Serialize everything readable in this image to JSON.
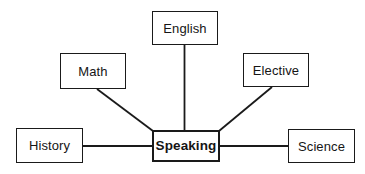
{
  "diagram": {
    "type": "mind-map",
    "background_color": "#ffffff",
    "line_color": "#1a1a1a",
    "text_color": "#151515",
    "central_node": {
      "id": "speaking",
      "label": "Speaking",
      "bold": true
    },
    "nodes": [
      {
        "id": "english",
        "label": "English"
      },
      {
        "id": "math",
        "label": "Math"
      },
      {
        "id": "elective",
        "label": "Elective"
      },
      {
        "id": "history",
        "label": "History"
      },
      {
        "id": "science",
        "label": "Science"
      }
    ],
    "connections": [
      {
        "from": "english",
        "to": "speaking",
        "style": "vertical"
      },
      {
        "from": "math",
        "to": "speaking",
        "style": "diagonal"
      },
      {
        "from": "elective",
        "to": "speaking",
        "style": "diagonal"
      },
      {
        "from": "history",
        "to": "speaking",
        "style": "horizontal"
      },
      {
        "from": "science",
        "to": "speaking",
        "style": "horizontal"
      }
    ]
  }
}
